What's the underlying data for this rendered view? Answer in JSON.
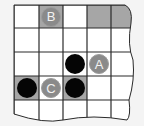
{
  "board": {
    "cols": [
      14,
      39,
      63,
      87,
      111,
      133
    ],
    "rows": [
      5,
      28,
      52,
      76,
      100,
      120
    ],
    "shade_color": "#a6a6a6",
    "line_color": "#2a2a2a",
    "background": "#ffffff",
    "shaded_cells": [
      [
        0,
        1
      ],
      [
        0,
        3
      ],
      [
        0,
        4
      ],
      [
        3,
        0
      ],
      [
        3,
        2
      ]
    ],
    "stones": [
      {
        "row": 0,
        "col": 1,
        "color": "gray",
        "label": "B"
      },
      {
        "row": 2,
        "col": 2,
        "color": "black",
        "label": ""
      },
      {
        "row": 2,
        "col": 3,
        "color": "gray",
        "label": "A"
      },
      {
        "row": 3,
        "col": 0,
        "color": "black",
        "label": ""
      },
      {
        "row": 3,
        "col": 1,
        "color": "gray",
        "label": "C"
      },
      {
        "row": 3,
        "col": 2,
        "color": "black",
        "label": ""
      }
    ]
  }
}
